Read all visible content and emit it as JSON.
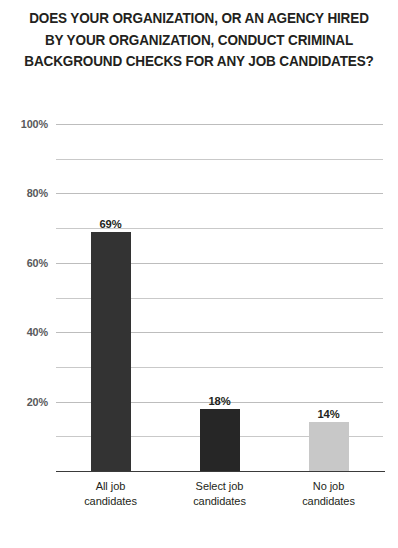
{
  "chart_data": {
    "type": "bar",
    "title": "DOES YOUR ORGANIZATION, OR AN AGENCY HIRED\nBY YOUR ORGANIZATION, CONDUCT CRIMINAL\nBACKGROUND CHECKS FOR ANY JOB CANDIDATES?",
    "title_line1": "DOES YOUR ORGANIZATION, OR AN AGENCY HIRED",
    "title_line2": "BY YOUR ORGANIZATION, CONDUCT CRIMINAL",
    "title_line3": "BACKGROUND CHECKS FOR ANY JOB CANDIDATES?",
    "xlabel": "",
    "ylabel": "",
    "ylim": [
      0,
      100
    ],
    "grid": true,
    "legend": false,
    "categories": [
      "All job\ncandidates",
      "Select job\ncandidates",
      "No job\ncandidates"
    ],
    "values": [
      69,
      18,
      14
    ],
    "value_labels": [
      "69%",
      "18%",
      "14%"
    ],
    "bar_colors": [
      "#333333",
      "#262626",
      "#c8c8c8"
    ],
    "y_ticks": [
      {
        "value": 100,
        "label": "100%",
        "major": true
      },
      {
        "value": 90,
        "label": "",
        "major": false
      },
      {
        "value": 80,
        "label": "80%",
        "major": true
      },
      {
        "value": 70,
        "label": "",
        "major": false
      },
      {
        "value": 60,
        "label": "60%",
        "major": true
      },
      {
        "value": 50,
        "label": "",
        "major": false
      },
      {
        "value": 40,
        "label": "40%",
        "major": true
      },
      {
        "value": 30,
        "label": "",
        "major": false
      },
      {
        "value": 20,
        "label": "20%",
        "major": true
      },
      {
        "value": 10,
        "label": "",
        "major": false
      }
    ],
    "y_tick_labels": [
      "100%",
      "80%",
      "60%",
      "40%",
      "20%"
    ],
    "colors": {
      "title": "#231f20",
      "gridline": "#c9c9c9",
      "axis": "#3a3a3a",
      "tick_label": "#58595b",
      "value_label": "#231f20",
      "background": "#ffffff",
      "bar_dark": "#333333",
      "bar_light": "#c8c8c8"
    }
  }
}
